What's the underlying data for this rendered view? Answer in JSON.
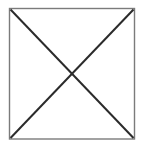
{
  "figure": {
    "title": "Square with both diagonals drawn",
    "canvas": {
      "width": 144,
      "height": 148,
      "background_color": "#ffffff"
    },
    "shapes": {
      "square": {
        "label": "square-outline",
        "x": 9.5,
        "y": 8.5,
        "width": 125,
        "height": 130.5,
        "stroke_color": "#7b7b7b",
        "stroke_width": 1.4,
        "fill_color": "#ffffff"
      },
      "diagonals": [
        {
          "label": "diagonal-top-left-to-bottom-right",
          "x1": 10.5,
          "y1": 9.5,
          "x2": 133.5,
          "y2": 138,
          "stroke_color": "#2b2b2b",
          "stroke_width": 2
        },
        {
          "label": "diagonal-top-right-to-bottom-left",
          "x1": 133.5,
          "y1": 9.5,
          "x2": 10.5,
          "y2": 138,
          "stroke_color": "#2b2b2b",
          "stroke_width": 2
        }
      ],
      "intersection": {
        "label": "diagonal-crossing-point",
        "x": 72,
        "y": 73.75
      }
    },
    "colors": {
      "outline": "#7b7b7b",
      "diagonal": "#2b2b2b",
      "background": "#ffffff"
    }
  }
}
